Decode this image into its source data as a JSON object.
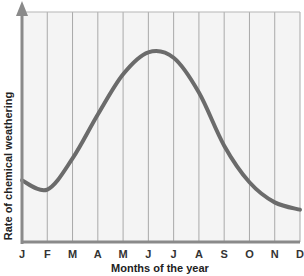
{
  "chart_data": {
    "type": "line",
    "title": "",
    "xlabel": "Months of the year",
    "ylabel": "Rate of chemical weathering",
    "categories": [
      "J",
      "F",
      "M",
      "A",
      "M",
      "J",
      "J",
      "A",
      "S",
      "O",
      "N",
      "D"
    ],
    "series": [
      {
        "name": "Rate of chemical weathering",
        "values": [
          26,
          21,
          38,
          62,
          84,
          96,
          93,
          74,
          45,
          25,
          14,
          10
        ]
      }
    ],
    "ylim": [
      0,
      100
    ],
    "grid": {
      "vertical": true,
      "horizontal": false
    },
    "legend": null,
    "colors": {
      "curve": "#6b6b6b",
      "axis": "#8a8a8a",
      "grid": "#a9a9a9",
      "plot_background": "#f4f4f4"
    }
  },
  "axes": {
    "x_label": "Months of the year",
    "y_label": "Rate of chemical weathering",
    "x_ticks": [
      "J",
      "F",
      "M",
      "A",
      "M",
      "J",
      "J",
      "A",
      "S",
      "O",
      "N",
      "D"
    ]
  }
}
